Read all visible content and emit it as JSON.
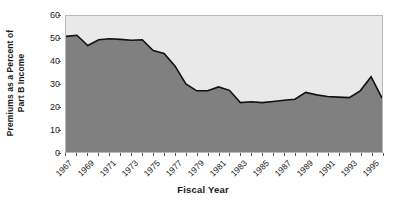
{
  "chart_data": {
    "type": "area",
    "title": "",
    "xlabel": "Fiscal Year",
    "ylabel": "Premiums as a Percent of Part B Income",
    "ylabel_line1": "Premiums as a Percent of",
    "ylabel_line2": "Part B Income",
    "ylim": [
      0,
      60
    ],
    "yticks": [
      0,
      10,
      20,
      30,
      40,
      50,
      60
    ],
    "ytick_labels": [
      "0",
      "10",
      "20",
      "30",
      "40",
      "50",
      "60"
    ],
    "xlim": [
      1967,
      1996
    ],
    "grid": false,
    "legend": null,
    "legend_position": "none",
    "area_fill_color": "#808080",
    "plot_background_color": "#e9e9e9",
    "line_color": "#111111",
    "axis_color": "#555555",
    "x": [
      1967,
      1968,
      1969,
      1970,
      1971,
      1972,
      1973,
      1974,
      1975,
      1976,
      1977,
      1978,
      1979,
      1980,
      1981,
      1982,
      1983,
      1984,
      1985,
      1986,
      1987,
      1988,
      1989,
      1990,
      1991,
      1992,
      1993,
      1994,
      1995,
      1996
    ],
    "values": [
      51.0,
      51.5,
      47.0,
      49.5,
      50.0,
      49.7,
      49.3,
      49.5,
      44.8,
      43.5,
      38.0,
      30.0,
      27.0,
      27.0,
      28.7,
      27.2,
      21.8,
      22.2,
      21.8,
      22.3,
      22.8,
      23.3,
      26.3,
      25.2,
      24.5,
      24.2,
      24.0,
      27.0,
      33.2,
      23.8
    ],
    "xtick_years_all": [
      1967,
      1968,
      1969,
      1970,
      1971,
      1972,
      1973,
      1974,
      1975,
      1976,
      1977,
      1978,
      1979,
      1980,
      1981,
      1982,
      1983,
      1984,
      1985,
      1986,
      1987,
      1988,
      1989,
      1990,
      1991,
      1992,
      1993,
      1994,
      1995,
      1996
    ],
    "xtick_labels": [
      "1967",
      "1969",
      "1971",
      "1973",
      "1975",
      "1977",
      "1979",
      "1981",
      "1983",
      "1985",
      "1987",
      "1989",
      "1991",
      "1993",
      "1995"
    ],
    "xtick_label_years": [
      1967,
      1969,
      1971,
      1973,
      1975,
      1977,
      1979,
      1981,
      1983,
      1985,
      1987,
      1989,
      1991,
      1993,
      1995
    ]
  }
}
